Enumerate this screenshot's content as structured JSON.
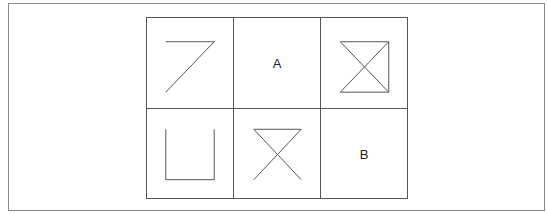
{
  "diagram": {
    "type": "figure-matrix-puzzle",
    "rows": 2,
    "columns": 3,
    "cells": [
      {
        "row": 1,
        "col": 1,
        "content": "figure",
        "figure": "seven-shape: horizontal top line with diagonal to bottom-left"
      },
      {
        "row": 1,
        "col": 2,
        "content": "label",
        "label": "A"
      },
      {
        "row": 1,
        "col": 3,
        "content": "figure",
        "figure": "hourglass with right vertical side (square with diagonals, left side open)"
      },
      {
        "row": 2,
        "col": 1,
        "content": "figure",
        "figure": "open-top square (U shape)"
      },
      {
        "row": 2,
        "col": 2,
        "content": "figure",
        "figure": "hourglass: top line with crossing diagonals, open bottom"
      },
      {
        "row": 2,
        "col": 3,
        "content": "label",
        "label": "B"
      }
    ],
    "line_color": "#555555"
  }
}
